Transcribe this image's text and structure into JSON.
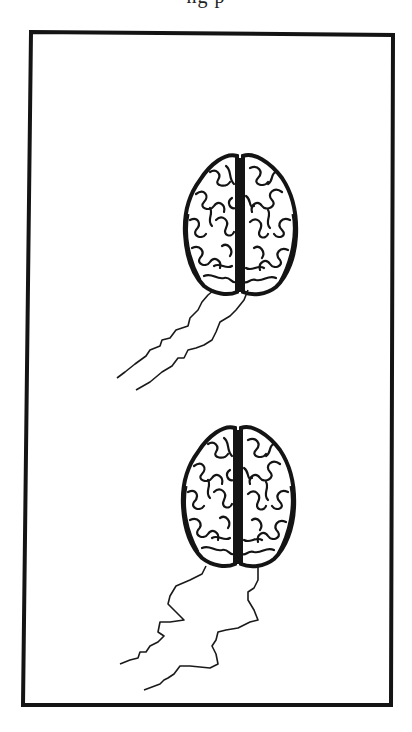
{
  "page": {
    "width": 412,
    "height": 732,
    "background": "#ffffff",
    "ink_color": "#141414"
  },
  "header": {
    "clipped_caption_fragment": "ng p"
  },
  "illustration": {
    "frame": {
      "stroke_width": 4,
      "corners": {
        "top_left": [
          31,
          32
        ],
        "top_right": [
          393,
          35
        ],
        "bottom_right": [
          391,
          705
        ],
        "bottom_left": [
          23,
          705
        ]
      }
    },
    "figures": [
      {
        "name": "brain-top-view",
        "icon": "brain-icon",
        "bbox": [
          185,
          155,
          295,
          293
        ],
        "lightning_bolts": 2
      },
      {
        "name": "brain-top-view",
        "icon": "brain-icon",
        "bbox": [
          185,
          425,
          292,
          566
        ],
        "lightning_bolts": 2
      }
    ]
  }
}
